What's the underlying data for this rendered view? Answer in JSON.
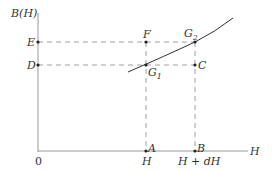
{
  "figure": {
    "y_axis_label": "B(H)",
    "x_axis_label": "H",
    "origin_label": "0",
    "points": {
      "E": "E",
      "D": "D",
      "F": "F",
      "G2_base": "G",
      "G2_sub": "2",
      "G1_base": "G",
      "G1_sub": "1",
      "C": "C",
      "A": "A",
      "B": "B"
    },
    "x_ticks": {
      "H": "H",
      "H_plus_dH": "H + dH"
    }
  },
  "colors": {
    "axis": "#999999",
    "dashed": "#888888",
    "curve": "#333333",
    "text": "#333333"
  }
}
